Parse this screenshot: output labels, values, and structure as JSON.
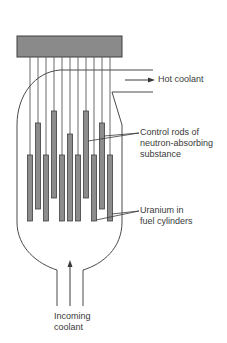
{
  "diagram": {
    "colors": {
      "line": "#4a4a4a",
      "head_fill": "#8a8a8a",
      "rod_fill": "#8c8c8c",
      "rod_stroke": "#3f3f3f",
      "text": "#3a3a3a"
    },
    "labels": {
      "hot_coolant": "Hot coolant",
      "control_rods": [
        "Control rods of",
        "neutron-absorbing",
        "substance"
      ],
      "uranium": [
        "Uranium in",
        "fuel cylinders"
      ],
      "incoming_coolant": [
        "Incoming",
        "coolant"
      ]
    },
    "fuel_rods": [
      {
        "x": 30,
        "top": 155,
        "bottom": 221
      },
      {
        "x": 46,
        "top": 155,
        "bottom": 221
      },
      {
        "x": 62,
        "top": 155,
        "bottom": 221
      },
      {
        "x": 78,
        "top": 155,
        "bottom": 221
      },
      {
        "x": 94,
        "top": 155,
        "bottom": 221
      },
      {
        "x": 110,
        "top": 155,
        "bottom": 221
      }
    ],
    "control_rods": [
      {
        "x": 38,
        "top": 123,
        "bottom": 209
      },
      {
        "x": 54,
        "top": 111,
        "bottom": 198
      },
      {
        "x": 70,
        "top": 134,
        "bottom": 221
      },
      {
        "x": 86,
        "top": 111,
        "bottom": 198
      },
      {
        "x": 102,
        "top": 123,
        "bottom": 209
      }
    ]
  }
}
